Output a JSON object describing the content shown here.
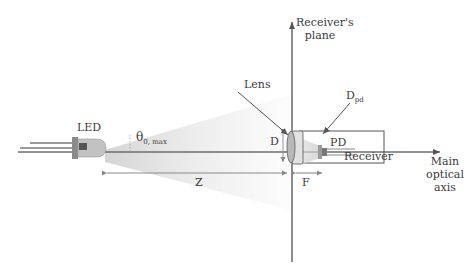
{
  "diagram": {
    "labels": {
      "led": "LED",
      "theta": "θ",
      "theta_sub": "0, max",
      "lens": "Lens",
      "receiver_plane_line1": "Receiver's",
      "receiver_plane_line2": "plane",
      "d_label": "D",
      "dpd": "D",
      "dpd_sub": "pd",
      "pd": "PD",
      "receiver": "Receiver",
      "axis_line1": "Main",
      "axis_line2": "optical",
      "axis_line3": "axis",
      "z": "Z",
      "f": "F"
    },
    "colors": {
      "line": "#6e6e6e",
      "beam": "#e8e8e8",
      "lens_fill": "#bcbcbc",
      "text": "#3a3a3a"
    }
  }
}
